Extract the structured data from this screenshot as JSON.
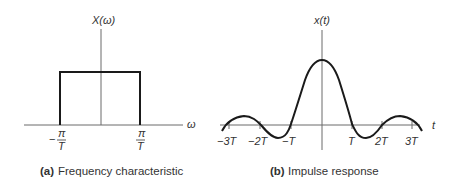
{
  "panel_a": {
    "y_label": "X(ω)",
    "x_label": "ω",
    "tick_left_num": "π",
    "tick_left_sign": "−",
    "tick_left_den": "T",
    "tick_right_num": "π",
    "tick_right_den": "T",
    "caption_tag": "(a)",
    "caption_text": "Frequency characteristic"
  },
  "panel_b": {
    "y_label": "x(t)",
    "x_label": "t",
    "ticks": [
      "−3T",
      "−2T",
      "−T",
      "T",
      "2T",
      "3T"
    ],
    "caption_tag": "(b)",
    "caption_text": "Impulse response"
  },
  "colors": {
    "axis": "#6a6a6a",
    "curve": "#1a1a1a",
    "text": "#333333"
  }
}
